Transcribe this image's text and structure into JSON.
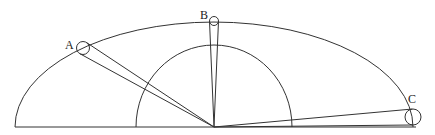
{
  "diagram": {
    "stroke_color": "#333333",
    "background": "#ffffff",
    "baseline": {
      "x1": 15,
      "y1": 127,
      "x2": 416,
      "y2": 127
    },
    "vertex": {
      "x": 214,
      "y": 127
    },
    "outer_arc": {
      "cx": 214,
      "cy": 127,
      "rx": 199,
      "ry": 105
    },
    "inner_arc": {
      "cx": 214,
      "cy": 127,
      "rx": 78,
      "ry": 82
    },
    "points": [
      {
        "label": "A",
        "cx": 83,
        "cy": 48,
        "r": 6.5,
        "label_x": 65,
        "label_y": 49
      },
      {
        "label": "B",
        "cx": 214,
        "cy": 21,
        "r": 4.5,
        "label_x": 200,
        "label_y": 19
      },
      {
        "label": "C",
        "cx": 413,
        "cy": 117,
        "r": 8,
        "label_x": 408,
        "label_y": 103
      }
    ]
  }
}
